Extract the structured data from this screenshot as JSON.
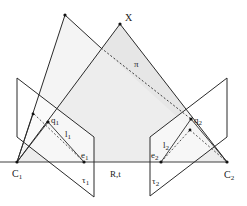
{
  "labels": {
    "X": "X",
    "pi": "π",
    "C1": "C",
    "C1_sub": "1",
    "C2": "C",
    "C2_sub": "2",
    "q1": "q",
    "q1_sub": "1",
    "q2": "q",
    "q2_sub": "2",
    "l1": "l",
    "l1_sub": "1",
    "l2": "l",
    "l2_sub": "2",
    "e1": "e",
    "e1_sub": "1",
    "e2": "e",
    "e2_sub": "2",
    "tau1": "τ",
    "tau1_sub": "1",
    "tau2": "τ",
    "tau2_sub": "2",
    "Rt": "R,t"
  },
  "colors": {
    "line": "#2a2a2a",
    "plane_fill": "#e8e8e8",
    "plane_fill_light": "#f1f1f1",
    "image_plane_fill": "#ffffff"
  }
}
